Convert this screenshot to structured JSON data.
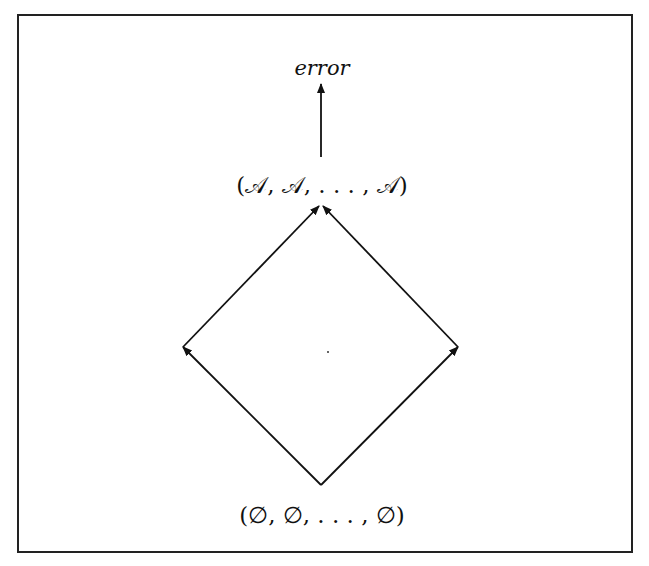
{
  "diagram": {
    "nodes": {
      "error": "error",
      "top": "(𝒜, 𝒜, . . . , 𝒜)",
      "bottom": "(∅, ∅, . . . , ∅)"
    },
    "edges": [
      {
        "from": "top",
        "to": "error"
      },
      {
        "from": "bottom",
        "to": "left"
      },
      {
        "from": "bottom",
        "to": "right"
      },
      {
        "from": "left",
        "to": "top"
      },
      {
        "from": "right",
        "to": "top"
      }
    ],
    "stroke_color": "#111111"
  }
}
